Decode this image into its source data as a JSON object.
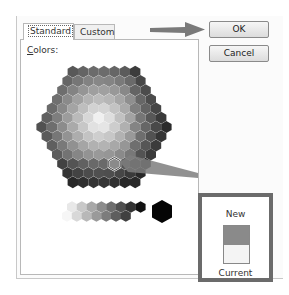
{
  "dialog": {
    "tabs": [
      {
        "label": "Standard",
        "active": true
      },
      {
        "label": "Custom",
        "active": false
      }
    ],
    "colors_label_first": "C",
    "colors_label_rest": "olors:",
    "buttons": {
      "ok": "OK",
      "cancel": "Cancel"
    },
    "preview": {
      "new_label": "New",
      "current_label": "Current",
      "new_color": "#8a8a8a",
      "current_color": "#f4f4f4"
    },
    "annotations": {
      "arrow_to_ok_color": "#7a7a7a",
      "arrow_to_preview_color": "#7a7a7a",
      "highlight_box_color": "#6b6b6b"
    }
  }
}
